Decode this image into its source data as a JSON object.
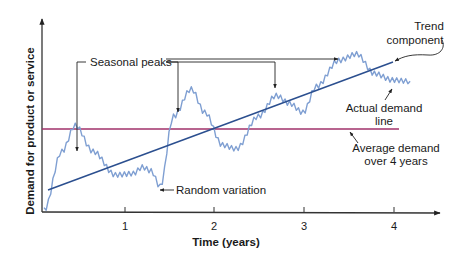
{
  "chart_data": {
    "type": "line",
    "title": "",
    "xlabel": "Time (years)",
    "ylabel": "Demand for product or service",
    "x_ticks": [
      "1",
      "2",
      "3",
      "4"
    ],
    "xlim": [
      0,
      4.2
    ],
    "y_ticks": [],
    "grid": false,
    "legend": null,
    "series": [
      {
        "name": "Actual demand line",
        "color": "#7f9fd2",
        "style": "jagged",
        "x": [
          0.0,
          0.2,
          0.35,
          0.55,
          0.8,
          1.0,
          1.1,
          1.2,
          1.3,
          1.45,
          1.65,
          1.8,
          2.0,
          2.15,
          2.4,
          2.6,
          2.75,
          2.9,
          3.05,
          3.3,
          3.5,
          3.7,
          3.9,
          4.1
        ],
        "values": [
          0.0,
          0.45,
          0.65,
          0.45,
          0.27,
          0.28,
          0.33,
          0.3,
          0.18,
          0.72,
          0.93,
          0.75,
          0.5,
          0.47,
          0.72,
          0.88,
          0.82,
          0.75,
          0.95,
          1.15,
          1.2,
          1.05,
          1.0,
          0.99
        ]
      },
      {
        "name": "Trend component",
        "color": "#2b4f8f",
        "style": "straight",
        "x": [
          0.05,
          4.0
        ],
        "values": [
          0.15,
          1.03
        ]
      },
      {
        "name": "Average demand over 4 years",
        "color": "#a0306a",
        "style": "horizontal",
        "x": [
          0.0,
          4.05
        ],
        "values": [
          0.62,
          0.62
        ]
      }
    ],
    "annotations": [
      {
        "text": "Seasonal peaks",
        "points_to": [
          "peak near year 0.4",
          "peak near year 1.6",
          "peak near year 2.6",
          "peak near year 3.5"
        ]
      },
      {
        "text": "Random variation",
        "points_to": "dip near year 1.3"
      },
      {
        "text": "Trend component",
        "points_to": "end of trend line"
      },
      {
        "text": "Actual demand line",
        "points_to": "demand curve near year 3.7"
      },
      {
        "text": "Average demand over 4 years",
        "points_to": "average line near year 3.3"
      }
    ]
  },
  "labels": {
    "y_axis_title": "Demand for product or service",
    "x_axis_title": "Time (years)",
    "tick_1": "1",
    "tick_2": "2",
    "tick_3": "3",
    "tick_4": "4",
    "seasonal_peaks": "Seasonal peaks",
    "random_variation": "Random variation",
    "trend_line1": "Trend",
    "trend_line2": "component",
    "actual_line1": "Actual demand",
    "actual_line2": "line",
    "average_line1": "Average demand",
    "average_line2": "over 4 years"
  },
  "colors": {
    "demand": "#7f9fd2",
    "trend": "#2b4f8f",
    "average": "#a0306a",
    "axis": "#333333"
  }
}
